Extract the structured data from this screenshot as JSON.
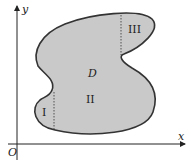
{
  "diagram": {
    "axes": {
      "x_label": "x",
      "y_label": "y",
      "origin_label": "O"
    },
    "region": {
      "label": "D",
      "fill": "#c9c9c9",
      "stroke": "#333333"
    },
    "subregions": [
      {
        "label": "I"
      },
      {
        "label": "II"
      },
      {
        "label": "III"
      }
    ]
  }
}
